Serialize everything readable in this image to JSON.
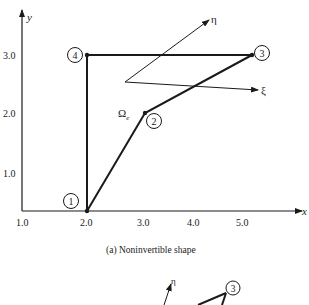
{
  "figure": {
    "caption": "(a) Noninvertible shape",
    "axes": {
      "x_label": "x",
      "y_label": "y",
      "x_ticks": [
        "1.0",
        "2.0",
        "3.0",
        "4.0",
        "5.0"
      ],
      "y_ticks": [
        "1.0",
        "2.0",
        "3.0"
      ]
    },
    "element_label": "Ω",
    "element_subscript": "e",
    "local_axes": {
      "eta": "η",
      "xi": "ξ"
    },
    "nodes": [
      {
        "id": "1",
        "x": 2.0,
        "y": 0.0
      },
      {
        "id": "2",
        "x": 3.0,
        "y": 2.0
      },
      {
        "id": "3",
        "x": 5.0,
        "y": 3.0
      },
      {
        "id": "4",
        "x": 2.0,
        "y": 3.0
      }
    ],
    "next_panel": {
      "eta": "η",
      "node": "3"
    }
  }
}
